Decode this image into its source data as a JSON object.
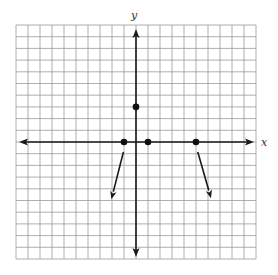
{
  "chart_data": {
    "type": "scatter",
    "title": "",
    "xlabel": "x",
    "ylabel": "y",
    "xlim": [
      -10,
      10
    ],
    "ylim": [
      -10,
      10
    ],
    "grid": true,
    "grid_step": 1,
    "points": [
      {
        "x": 0,
        "y": 3
      },
      {
        "x": -1,
        "y": 0
      },
      {
        "x": 1,
        "y": 0
      },
      {
        "x": 5,
        "y": 0
      }
    ],
    "rays": [
      {
        "from": {
          "x": -1.05,
          "y": -0.85
        },
        "to": {
          "x": -2.05,
          "y": -4.9
        },
        "direction": "down-left"
      },
      {
        "from": {
          "x": 5.15,
          "y": -0.85
        },
        "to": {
          "x": 6.25,
          "y": -4.8
        },
        "direction": "down-right"
      }
    ]
  },
  "labels": {
    "x_axis": "x",
    "y_axis": "y"
  },
  "colors": {
    "grid": "#9a9a9a",
    "axis": "#1a1a1a",
    "point": "#111111"
  }
}
